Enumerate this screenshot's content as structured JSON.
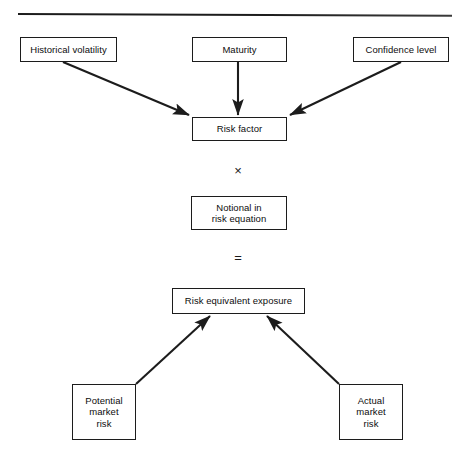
{
  "diagram": {
    "type": "flowchart",
    "line_color": "#1c1c1c",
    "box_fill": "#ffffff",
    "text_color": "#0d0d0d",
    "divider": {
      "name": "top-horizontal-rule"
    },
    "nodes": [
      {
        "id": "historical-volatility",
        "label": "Historical volatility",
        "x": 20,
        "y": 37,
        "w": 97,
        "h": 25
      },
      {
        "id": "maturity",
        "label": "Maturity",
        "x": 192,
        "y": 37,
        "w": 95,
        "h": 25
      },
      {
        "id": "confidence-level",
        "label": "Confidence level",
        "x": 353,
        "y": 37,
        "w": 96,
        "h": 25
      },
      {
        "id": "risk-factor",
        "label": "Risk factor",
        "x": 192,
        "y": 117,
        "w": 95,
        "h": 24
      },
      {
        "id": "notional-in-risk-equation",
        "label": "Notional in\nrisk equation",
        "x": 191,
        "y": 196,
        "w": 96,
        "h": 34
      },
      {
        "id": "risk-equivalent-exposure",
        "label": "Risk equivalent exposure",
        "x": 172,
        "y": 288,
        "w": 133,
        "h": 26
      },
      {
        "id": "potential-market-risk",
        "label": "Potential\nmarket\nrisk",
        "x": 72,
        "y": 384,
        "w": 64,
        "h": 56
      },
      {
        "id": "actual-market-risk",
        "label": "Actual\nmarket\nrisk",
        "x": 339,
        "y": 384,
        "w": 64,
        "h": 56
      }
    ],
    "operators": [
      {
        "id": "multiply",
        "symbol": "×",
        "x": 238,
        "y": 171
      },
      {
        "id": "equals",
        "symbol": "=",
        "x": 238,
        "y": 258
      }
    ],
    "edges": [
      {
        "id": "historical-volatility-to-risk-factor",
        "from": "historical-volatility",
        "to": "risk-factor",
        "x1": 63,
        "y1": 62,
        "x2": 189,
        "y2": 115
      },
      {
        "id": "maturity-to-risk-factor",
        "from": "maturity",
        "to": "risk-factor",
        "x1": 238,
        "y1": 62,
        "x2": 238,
        "y2": 115
      },
      {
        "id": "confidence-level-to-risk-factor",
        "from": "confidence-level",
        "to": "risk-factor",
        "x1": 401,
        "y1": 62,
        "x2": 290,
        "y2": 115
      },
      {
        "id": "potential-market-risk-to-risk-equivalent-exposure",
        "from": "potential-market-risk",
        "to": "risk-equivalent-exposure",
        "x1": 136,
        "y1": 384,
        "x2": 210,
        "y2": 316
      },
      {
        "id": "actual-market-risk-to-risk-equivalent-exposure",
        "from": "actual-market-risk",
        "to": "risk-equivalent-exposure",
        "x1": 339,
        "y1": 384,
        "x2": 267,
        "y2": 316
      }
    ]
  }
}
